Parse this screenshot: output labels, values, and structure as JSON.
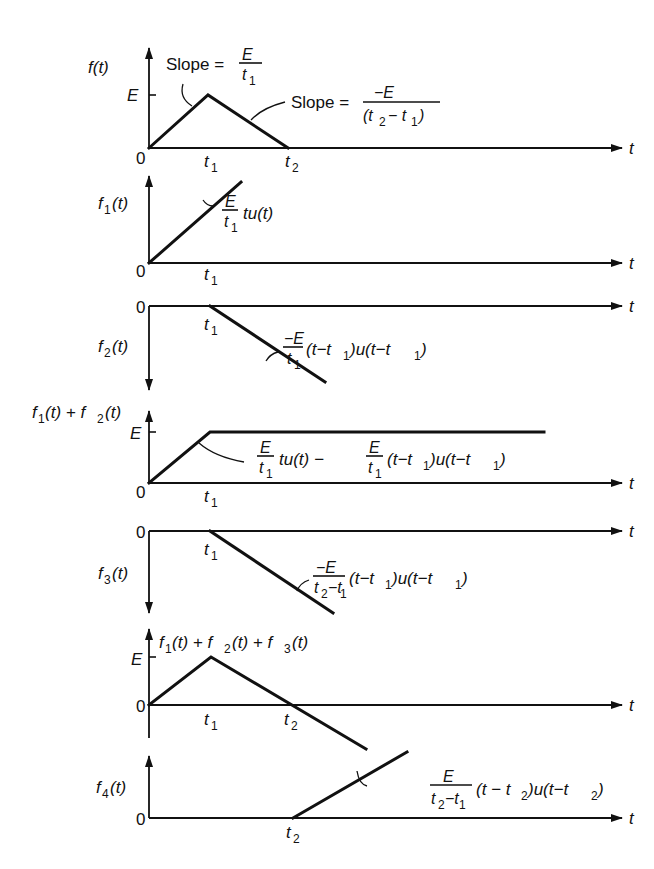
{
  "diagram": {
    "common": {
      "time_axis_label": "t",
      "origin_label": "0",
      "amplitude_label": "E",
      "t1_label": "t",
      "t1_sub": "1",
      "t2_label": "t",
      "t2_sub": "2"
    },
    "panels": [
      {
        "id": "f",
        "ylabel": "f(t)",
        "annotations": [
          {
            "text": "Slope = ",
            "num": "E",
            "den": "t1",
            "den_main": "t",
            "den_sub": "1"
          },
          {
            "text": "Slope = ",
            "num": "−E",
            "den": "(t2 − t1)"
          }
        ]
      },
      {
        "id": "f1",
        "ylabel_main": "f",
        "ylabel_sub": "1",
        "ylabel_tail": "(t)",
        "annotation": {
          "num": "E",
          "den": "t1",
          "tail": "tu(t)"
        }
      },
      {
        "id": "f2",
        "ylabel_main": "f",
        "ylabel_sub": "2",
        "ylabel_tail": "(t)",
        "annotation": {
          "num": "−E",
          "den": "t1",
          "tail": "(t−t1)u(t−t1)"
        }
      },
      {
        "id": "f1_plus_f2",
        "ylabel": "f1(t) + f2(t)",
        "annotation": {
          "num1": "E",
          "den1": "t1",
          "mid": "tu(t) −",
          "num2": "E",
          "den2": "t1",
          "tail": "(t−t1)u(t−t1)"
        }
      },
      {
        "id": "f3",
        "ylabel_main": "f",
        "ylabel_sub": "3",
        "ylabel_tail": "(t)",
        "annotation": {
          "num": "−E",
          "den": "t2−t1",
          "tail": "(t−t1)u(t−t1)"
        }
      },
      {
        "id": "f1_plus_f2_plus_f3",
        "ylabel": "f1(t) + f2(t) + f3(t)"
      },
      {
        "id": "f4",
        "ylabel_main": "f",
        "ylabel_sub": "4",
        "ylabel_tail": "(t)",
        "annotation": {
          "num": "E",
          "den": "t2−t1",
          "tail": "(t−t2)u(t−t2)"
        }
      }
    ]
  }
}
